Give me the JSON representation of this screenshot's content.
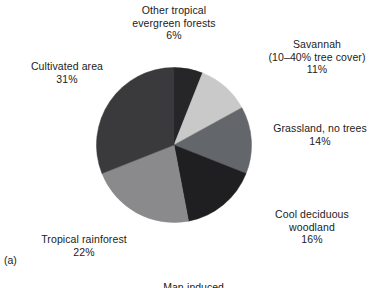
{
  "figure": {
    "panel_label": "(a)",
    "clipped_caption": "Man-induced"
  },
  "chart_data": {
    "type": "pie",
    "title": "",
    "subtitle": "",
    "xlabel": "",
    "ylabel": "",
    "legend_position": "none",
    "grid": false,
    "units": "percent",
    "start_angle_deg": 0,
    "direction": "clockwise",
    "total": 100,
    "categories": [
      "Other tropical evergreen forests",
      "Savannah (10–40% tree cover)",
      "Grassland, no trees",
      "Cool deciduous woodland",
      "Tropical rainforest",
      "Cultivated area"
    ],
    "values": [
      6,
      11,
      14,
      16,
      22,
      31
    ],
    "colors": [
      "#262628",
      "#c9c9c9",
      "#63666a",
      "#1f1f21",
      "#8a8a8c",
      "#3a3a3c"
    ],
    "slices": [
      {
        "id": "other-tropical-evergreen-forests",
        "name_line1": "Other tropical",
        "name_line2": "evergreen forests",
        "value": 6,
        "value_label": "6%",
        "color": "#262628"
      },
      {
        "id": "savannah",
        "name_line1": "Savannah",
        "name_line2": "(10–40% tree cover)",
        "value": 11,
        "value_label": "11%",
        "color": "#c9c9c9"
      },
      {
        "id": "grassland-no-trees",
        "name_line1": "Grassland, no trees",
        "name_line2": "",
        "value": 14,
        "value_label": "14%",
        "color": "#63666a"
      },
      {
        "id": "cool-deciduous-woodland",
        "name_line1": "Cool deciduous",
        "name_line2": "woodland",
        "value": 16,
        "value_label": "16%",
        "color": "#1f1f21"
      },
      {
        "id": "tropical-rainforest",
        "name_line1": "Tropical rainforest",
        "name_line2": "",
        "value": 22,
        "value_label": "22%",
        "color": "#8a8a8c"
      },
      {
        "id": "cultivated-area",
        "name_line1": "Cultivated area",
        "name_line2": "",
        "value": 31,
        "value_label": "31%",
        "color": "#3a3a3c"
      }
    ]
  }
}
